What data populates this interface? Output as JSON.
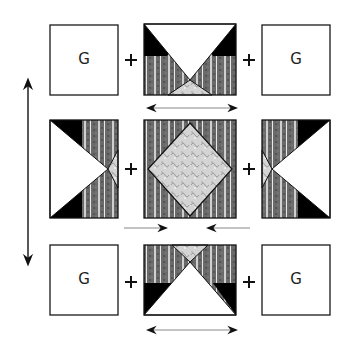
{
  "diagram": {
    "colors": {
      "outline": "#1a1a1a",
      "dark_triangle": "#000000",
      "striped_fabric": "#6e6e6e",
      "light_print": "#d8d8d8",
      "background": "#ffffff"
    },
    "rows": [
      {
        "name": "top-row",
        "blocks": [
          {
            "type": "plain-square",
            "label": "G"
          },
          {
            "type": "flying-geese-down"
          },
          {
            "type": "plain-square",
            "label": "G"
          }
        ],
        "joiners": [
          "+",
          "+"
        ],
        "press_arrow": "double-headed"
      },
      {
        "name": "middle-row",
        "blocks": [
          {
            "type": "flying-geese-right"
          },
          {
            "type": "square-in-a-square"
          },
          {
            "type": "flying-geese-left"
          }
        ],
        "joiners": [
          "+",
          "+"
        ],
        "press_arrow": "inward-pointing"
      },
      {
        "name": "bottom-row",
        "blocks": [
          {
            "type": "plain-square",
            "label": "G"
          },
          {
            "type": "flying-geese-up"
          },
          {
            "type": "plain-square",
            "label": "G"
          }
        ],
        "joiners": [
          "+",
          "+"
        ],
        "press_arrow": "double-headed"
      }
    ],
    "vertical_arrow": "double-headed",
    "labels": {
      "g_top_left": "G",
      "g_top_right": "G",
      "g_bottom_left": "G",
      "g_bottom_right": "G",
      "plus": "+"
    }
  }
}
